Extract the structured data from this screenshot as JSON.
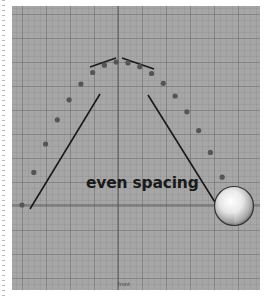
{
  "viewport": {
    "camera_label": "front",
    "annotation": "even spacing",
    "background_color": "#a6a6a6",
    "axis_color": "#555555",
    "dot_color": "#555555",
    "stroke_color": "#1a1a1a"
  },
  "trajectory": {
    "description": "evenly spaced ball positions along a parabolic arc",
    "dot_count": 19,
    "object": "sphere"
  }
}
